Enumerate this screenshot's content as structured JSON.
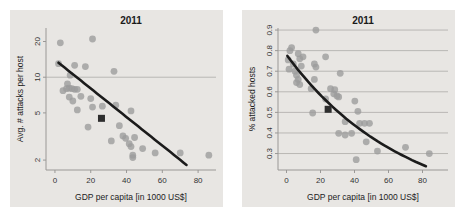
{
  "figure": {
    "background": "#ffffff",
    "panel_background": "#e8e6e3"
  },
  "colors": {
    "grid": "#b9b7b4",
    "axis": "#9a9896",
    "tick_label": "#333333",
    "title": "#1a1a1a",
    "axis_label": "#222222",
    "point": "#9b9b9b",
    "trend_line": "#1b1b1b",
    "square_marker": "#2e2e2e"
  },
  "chart_data": [
    {
      "type": "scatter",
      "title": "2011",
      "xlabel": "GDP per capita [in 1000 US$]",
      "ylabel": "Avg. # attacks per host",
      "xscale": "linear",
      "yscale": "log",
      "xlim": [
        -5,
        90
      ],
      "ylim": [
        1.65,
        26
      ],
      "xticks": [
        "0",
        "20",
        "40",
        "60",
        "80"
      ],
      "xtick_values": [
        0,
        20,
        40,
        60,
        80
      ],
      "yticks": [
        "2",
        "5",
        "10",
        "20"
      ],
      "ytick_values": [
        2,
        5,
        10,
        20
      ],
      "gridlines_y": [
        10
      ],
      "legend": "none",
      "points": [
        [
          3,
          19.5
        ],
        [
          21,
          21
        ],
        [
          2,
          13
        ],
        [
          11,
          12.6
        ],
        [
          17,
          12.3
        ],
        [
          33,
          11.2
        ],
        [
          8.5,
          10.4
        ],
        [
          7,
          8.8
        ],
        [
          4.5,
          7.7
        ],
        [
          6.5,
          8.0
        ],
        [
          8,
          8.1
        ],
        [
          9.5,
          8.0
        ],
        [
          11,
          7.9
        ],
        [
          12.5,
          7.9
        ],
        [
          10,
          6.3
        ],
        [
          20,
          6.6
        ],
        [
          8,
          6.8
        ],
        [
          14.5,
          6.9
        ],
        [
          21,
          5.6
        ],
        [
          12.5,
          5.3
        ],
        [
          26.5,
          5.7
        ],
        [
          34,
          5.8
        ],
        [
          18.5,
          3.8
        ],
        [
          36,
          3.9
        ],
        [
          42.5,
          5.2
        ],
        [
          38,
          3.2
        ],
        [
          31.5,
          2.9
        ],
        [
          41.5,
          2.75
        ],
        [
          39.5,
          3.05
        ],
        [
          44.5,
          3.1
        ],
        [
          42.5,
          2.6
        ],
        [
          49,
          2.5
        ],
        [
          56,
          2.3
        ],
        [
          43.5,
          2.2
        ],
        [
          43.5,
          2.1
        ],
        [
          70,
          2.3
        ],
        [
          86,
          2.2
        ]
      ],
      "square_marker": [
        26,
        4.5
      ],
      "trend": {
        "type": "exponential",
        "y_at_0": 14,
        "decay_rate": 0.02775,
        "x_start": 2,
        "x_end": 73.5
      }
    },
    {
      "type": "scatter",
      "title": "2011",
      "xlabel": "GDP per capita [in 1000 US$]",
      "ylabel": "% attacked hosts",
      "xscale": "linear",
      "yscale": "linear",
      "xlim": [
        -5,
        95
      ],
      "ylim": [
        0.22,
        0.91
      ],
      "xticks": [
        "0",
        "20",
        "40",
        "60",
        "80"
      ],
      "xtick_values": [
        0,
        20,
        40,
        60,
        80
      ],
      "yticks": [
        "0.3",
        "0.4",
        "0.5",
        "0.6",
        "0.7",
        "0.8",
        "0.9"
      ],
      "ytick_values": [
        0.3,
        0.4,
        0.5,
        0.6,
        0.7,
        0.8,
        0.9
      ],
      "gridlines_y": [
        0.3,
        0.4,
        0.5,
        0.6,
        0.7,
        0.8,
        0.9
      ],
      "legend": "none",
      "points": [
        [
          17.3,
          0.9
        ],
        [
          3,
          0.815
        ],
        [
          2,
          0.8
        ],
        [
          6.9,
          0.785
        ],
        [
          9.7,
          0.77
        ],
        [
          23,
          0.77
        ],
        [
          7.8,
          0.76
        ],
        [
          1,
          0.755
        ],
        [
          4,
          0.735
        ],
        [
          16.4,
          0.735
        ],
        [
          8.7,
          0.725
        ],
        [
          17.3,
          0.72
        ],
        [
          1.5,
          0.71
        ],
        [
          5,
          0.7
        ],
        [
          31.6,
          0.69
        ],
        [
          5.9,
          0.68
        ],
        [
          6.9,
          0.66
        ],
        [
          16.4,
          0.66
        ],
        [
          5.9,
          0.645
        ],
        [
          7.8,
          0.635
        ],
        [
          14.5,
          0.615
        ],
        [
          25.9,
          0.615
        ],
        [
          28.4,
          0.61
        ],
        [
          27.8,
          0.59
        ],
        [
          29.7,
          0.58
        ],
        [
          30.7,
          0.575
        ],
        [
          23,
          0.565
        ],
        [
          40.2,
          0.555
        ],
        [
          42,
          0.505
        ],
        [
          15.4,
          0.497
        ],
        [
          34.5,
          0.455
        ],
        [
          43,
          0.447
        ],
        [
          45.9,
          0.447
        ],
        [
          48.8,
          0.447
        ],
        [
          30.7,
          0.398
        ],
        [
          38.3,
          0.398
        ],
        [
          34.5,
          0.39
        ],
        [
          46.9,
          0.357
        ],
        [
          53.5,
          0.312
        ],
        [
          41,
          0.27
        ],
        [
          70,
          0.33
        ],
        [
          84,
          0.3
        ]
      ],
      "square_marker": [
        24.5,
        0.515
      ],
      "trend": {
        "type": "exponential",
        "y_at_0": 0.78,
        "decay_rate": 0.01445,
        "x_start": 0.5,
        "x_end": 82
      }
    }
  ]
}
